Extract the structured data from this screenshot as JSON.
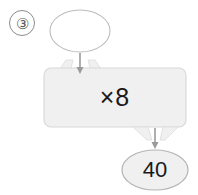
{
  "exercise": {
    "number_label": "③",
    "number_icon": "circled-three-icon"
  },
  "diagram": {
    "type": "function-machine",
    "input_bubble": {
      "name": "input-ellipse",
      "value": "",
      "placeholder": "",
      "fill": "#ffffff",
      "stroke": "#b9b9b9"
    },
    "top_arrow": {
      "name": "arrow-down-into-machine-icon",
      "direction": "down",
      "color": "#9a9a9a"
    },
    "machine_box": {
      "name": "operation-box",
      "operator_label": "×8",
      "fill": "#f0f0f0",
      "stroke": "#d2d2d2"
    },
    "bottom_arrow": {
      "name": "arrow-down-out-of-machine-icon",
      "direction": "down",
      "color": "#9a9a9a"
    },
    "output_bubble": {
      "name": "output-ellipse",
      "value": "40",
      "fill": "#f0f0f0",
      "stroke": "#b0b0b0"
    }
  }
}
